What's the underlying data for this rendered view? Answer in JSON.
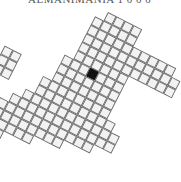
{
  "title": "ALMANIMANIA 1 0 0 0",
  "map": {
    "type": "tile-grid",
    "rotation_deg": 27,
    "cell_size": 9.6,
    "origin": [
      108,
      12
    ],
    "colors": {
      "cell_fill": "#f2f2f2",
      "cell_stroke": "#6a6a6a",
      "highlight": "#111111"
    },
    "highlight_cell": [
      1,
      6
    ],
    "cells": [
      [
        0,
        0
      ],
      [
        1,
        0
      ],
      [
        2,
        0
      ],
      [
        3,
        0
      ],
      [
        -1,
        1
      ],
      [
        0,
        1
      ],
      [
        1,
        1
      ],
      [
        2,
        1
      ],
      [
        3,
        1
      ],
      [
        -1,
        2
      ],
      [
        0,
        2
      ],
      [
        1,
        2
      ],
      [
        2,
        2
      ],
      [
        3,
        2
      ],
      [
        4,
        2
      ],
      [
        5,
        2
      ],
      [
        6,
        2
      ],
      [
        7,
        2
      ],
      [
        8,
        2
      ],
      [
        -1,
        3
      ],
      [
        0,
        3
      ],
      [
        1,
        3
      ],
      [
        2,
        3
      ],
      [
        3,
        3
      ],
      [
        4,
        3
      ],
      [
        5,
        3
      ],
      [
        6,
        3
      ],
      [
        7,
        3
      ],
      [
        8,
        3
      ],
      [
        9,
        3
      ],
      [
        -1,
        4
      ],
      [
        0,
        4
      ],
      [
        1,
        4
      ],
      [
        2,
        4
      ],
      [
        3,
        4
      ],
      [
        4,
        4
      ],
      [
        5,
        4
      ],
      [
        6,
        4
      ],
      [
        7,
        4
      ],
      [
        8,
        4
      ],
      [
        9,
        4
      ],
      [
        -1,
        5
      ],
      [
        0,
        5
      ],
      [
        1,
        5
      ],
      [
        2,
        5
      ],
      [
        3,
        5
      ],
      [
        4,
        5
      ],
      [
        -2,
        6
      ],
      [
        -1,
        6
      ],
      [
        0,
        6
      ],
      [
        1,
        6
      ],
      [
        2,
        6
      ],
      [
        3,
        6
      ],
      [
        4,
        6
      ],
      [
        -2,
        7
      ],
      [
        -1,
        7
      ],
      [
        0,
        7
      ],
      [
        1,
        7
      ],
      [
        2,
        7
      ],
      [
        3,
        7
      ],
      [
        4,
        7
      ],
      [
        -2,
        8
      ],
      [
        -1,
        8
      ],
      [
        0,
        8
      ],
      [
        1,
        8
      ],
      [
        2,
        8
      ],
      [
        3,
        8
      ],
      [
        4,
        8
      ],
      [
        -3,
        9
      ],
      [
        -2,
        9
      ],
      [
        -1,
        9
      ],
      [
        0,
        9
      ],
      [
        1,
        9
      ],
      [
        2,
        9
      ],
      [
        3,
        9
      ],
      [
        4,
        9
      ],
      [
        -3,
        10
      ],
      [
        -2,
        10
      ],
      [
        -1,
        10
      ],
      [
        0,
        10
      ],
      [
        1,
        10
      ],
      [
        2,
        10
      ],
      [
        3,
        10
      ],
      [
        4,
        10
      ],
      [
        5,
        10
      ],
      [
        -4,
        11
      ],
      [
        -3,
        11
      ],
      [
        -2,
        11
      ],
      [
        -1,
        11
      ],
      [
        0,
        11
      ],
      [
        1,
        11
      ],
      [
        2,
        11
      ],
      [
        3,
        11
      ],
      [
        4,
        11
      ],
      [
        5,
        11
      ],
      [
        6,
        11
      ],
      [
        -5,
        12
      ],
      [
        -4,
        12
      ],
      [
        -3,
        12
      ],
      [
        -2,
        12
      ],
      [
        -1,
        12
      ],
      [
        0,
        12
      ],
      [
        1,
        12
      ],
      [
        2,
        12
      ],
      [
        3,
        12
      ],
      [
        4,
        12
      ],
      [
        5,
        12
      ],
      [
        6,
        12
      ],
      [
        -6,
        13
      ],
      [
        -5,
        13
      ],
      [
        -4,
        13
      ],
      [
        -3,
        13
      ],
      [
        -2,
        13
      ],
      [
        -1,
        13
      ],
      [
        0,
        13
      ],
      [
        1,
        13
      ],
      [
        2,
        13
      ],
      [
        3,
        13
      ],
      [
        4,
        13
      ],
      [
        -7,
        14
      ],
      [
        -6,
        14
      ],
      [
        -5,
        14
      ],
      [
        -4,
        14
      ],
      [
        -3,
        14
      ],
      [
        -2,
        14
      ],
      [
        -1,
        14
      ],
      [
        0,
        14
      ],
      [
        1,
        14
      ],
      [
        -8,
        15
      ],
      [
        -7,
        15
      ],
      [
        -6,
        15
      ],
      [
        -5,
        15
      ],
      [
        -4,
        15
      ],
      [
        -3,
        15
      ],
      [
        -2,
        15
      ],
      [
        -8,
        16
      ],
      [
        -7,
        16
      ],
      [
        -6,
        16
      ],
      [
        -5,
        16
      ],
      [
        -9,
        17
      ],
      [
        -8,
        17
      ],
      [
        -7,
        17
      ]
    ],
    "island": [
      [
        -8,
        8
      ],
      [
        -7,
        8
      ],
      [
        -9,
        9
      ],
      [
        -8,
        9
      ],
      [
        -7,
        9
      ],
      [
        -10,
        10
      ],
      [
        -9,
        10
      ],
      [
        -8,
        10
      ],
      [
        -7,
        10
      ],
      [
        -10,
        11
      ],
      [
        -9,
        11
      ],
      [
        -8,
        11
      ],
      [
        -10,
        12
      ],
      [
        -9,
        12
      ]
    ]
  }
}
